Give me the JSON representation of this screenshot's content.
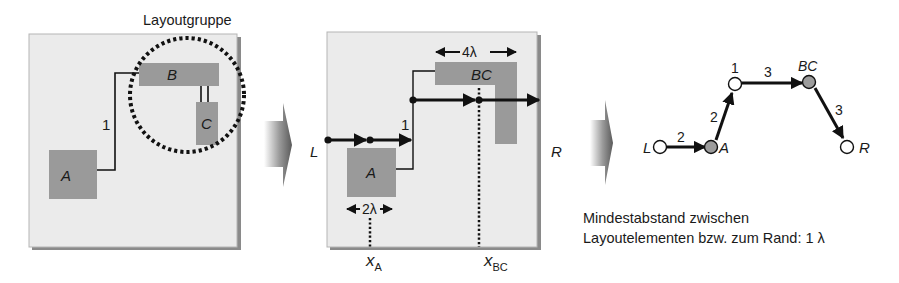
{
  "panel1": {
    "group_label": "Layoutgruppe",
    "elements": [
      {
        "id": "A",
        "label": "A"
      },
      {
        "id": "B",
        "label": "B"
      },
      {
        "id": "C",
        "label": "C"
      }
    ],
    "connection_label": "1"
  },
  "panel2": {
    "left_label": "L",
    "right_label": "R",
    "element_A": "A",
    "element_BC": "BC",
    "connection_label": "1",
    "width_A": "2λ",
    "width_BC": "4λ",
    "x_A": {
      "base": "x",
      "sub": "A"
    },
    "x_BC": {
      "base": "x",
      "sub": "BC"
    }
  },
  "graph": {
    "nodes": [
      {
        "id": "L",
        "label": "L",
        "filled": false
      },
      {
        "id": "A",
        "label": "A",
        "filled": true
      },
      {
        "id": "1",
        "label": "1",
        "filled": false
      },
      {
        "id": "BC",
        "label": "BC",
        "filled": true
      },
      {
        "id": "R",
        "label": "R",
        "filled": false
      }
    ],
    "edges": [
      {
        "from": "L",
        "to": "A",
        "weight": "2"
      },
      {
        "from": "A",
        "to": "1",
        "weight": "2"
      },
      {
        "from": "1",
        "to": "BC",
        "weight": "3"
      },
      {
        "from": "BC",
        "to": "R",
        "weight": "3"
      }
    ]
  },
  "caption": {
    "line1": "Mindestabstand zwischen",
    "line2": "Layoutelementen bzw. zum Rand: 1 λ"
  },
  "colors": {
    "panel_bg": "#ebebeb",
    "panel_shadow": "#8a8a8a",
    "element_fill": "#9a9a9a",
    "node_filled": "#9c9c9c",
    "line": "#111111"
  }
}
